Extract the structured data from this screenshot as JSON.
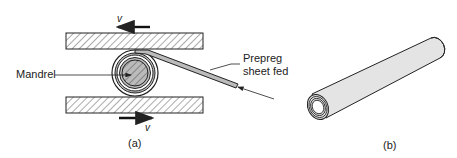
{
  "figure": {
    "panel_a": {
      "caption": "(a)",
      "labels": {
        "mandrel": "Mandrel",
        "prepreg_line1": "Prepreg",
        "prepreg_line2": "sheet fed",
        "velocity_top": "v",
        "velocity_bottom": "v"
      },
      "parts": [
        "top-plate",
        "bottom-plate",
        "mandrel",
        "rolled-prepreg",
        "prepreg-sheet"
      ],
      "motion": {
        "top_plate": "left",
        "bottom_plate": "right"
      }
    },
    "panel_b": {
      "caption": "(b)",
      "parts": [
        "rolled-tube"
      ]
    },
    "colors": {
      "line": "#222222",
      "hatch": "#444444",
      "tube_fill": "#e6e6e6",
      "background": "#ffffff"
    }
  }
}
